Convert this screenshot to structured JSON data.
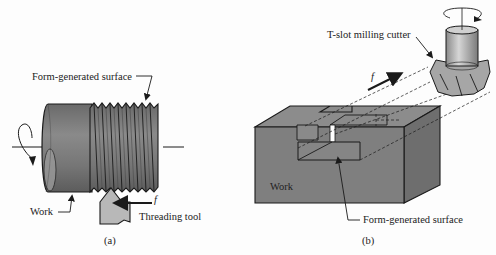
{
  "panel_a": {
    "caption": "(a)",
    "label_surface": "Form-generated surface",
    "label_work": "Work",
    "label_tool": "Threading tool",
    "label_feed": "f",
    "colors": {
      "work": "#7d7d7d",
      "work_dark": "#5a5a5a",
      "tool": "#b4b4b4",
      "outline": "#1a1a1a"
    }
  },
  "panel_b": {
    "caption": "(b)",
    "label_cutter": "T-slot milling cutter",
    "label_work": "Work",
    "label_surface": "Form-generated surface",
    "label_feed": "f",
    "colors": {
      "front": "#7f7f7f",
      "top": "#8c8c8c",
      "side": "#6e6e6e",
      "cutter": "#a8a8a8",
      "outline": "#1a1a1a"
    }
  }
}
